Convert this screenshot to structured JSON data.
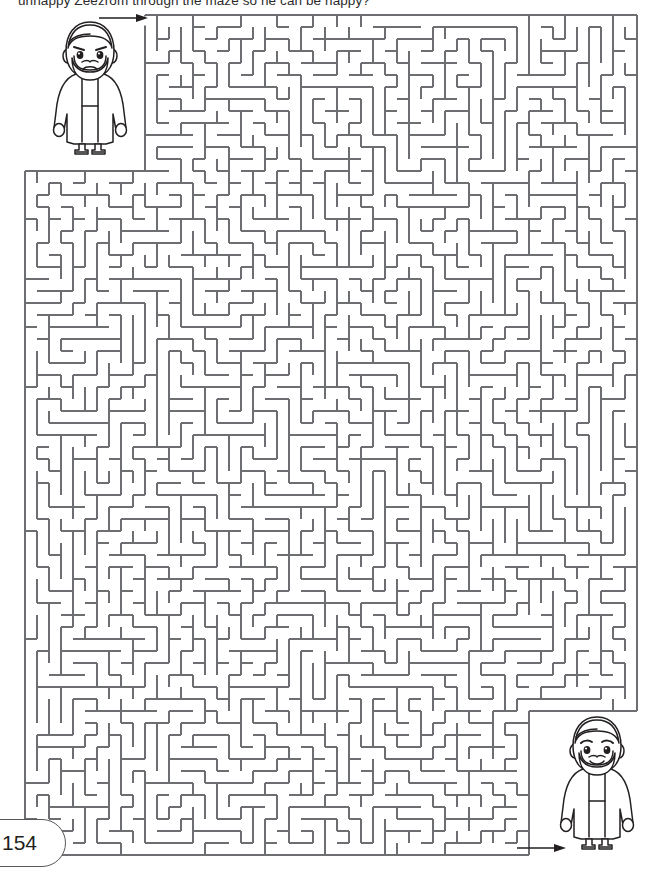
{
  "page": {
    "number": "154",
    "background_color": "#ffffff",
    "ink_color": "#231f20",
    "wall_color": "#6d6e71"
  },
  "instruction": {
    "text": "unhappy Zeezrom through the maze so he can be happy?",
    "note_clipped_top": true
  },
  "maze": {
    "title": "maze-puzzle",
    "shape": "notched-rectangle",
    "cell_size_px": 12,
    "columns": 51,
    "rows": 70,
    "outer_bounds": {
      "left": 25,
      "top": 15,
      "right": 640,
      "bottom": 855
    },
    "upper_section_left": 147,
    "upper_section_bottom": 165,
    "notch": {
      "left": 523,
      "top": 705,
      "right": 640,
      "bottom": 855
    },
    "entrance": {
      "label": "entrance-arrow",
      "direction": "right",
      "x": 98,
      "y": 10
    },
    "exit": {
      "label": "exit-arrow",
      "direction": "right",
      "x": 516,
      "y": 840
    }
  },
  "characters": [
    {
      "id": "character-sad",
      "name": "Zeezrom",
      "mood": "unhappy",
      "description": "bearded man in robe with sad frowning face",
      "position": "top-left"
    },
    {
      "id": "character-happy",
      "name": "Zeezrom",
      "mood": "happy",
      "description": "bearded man in robe with smiling face",
      "position": "bottom-right"
    }
  ]
}
